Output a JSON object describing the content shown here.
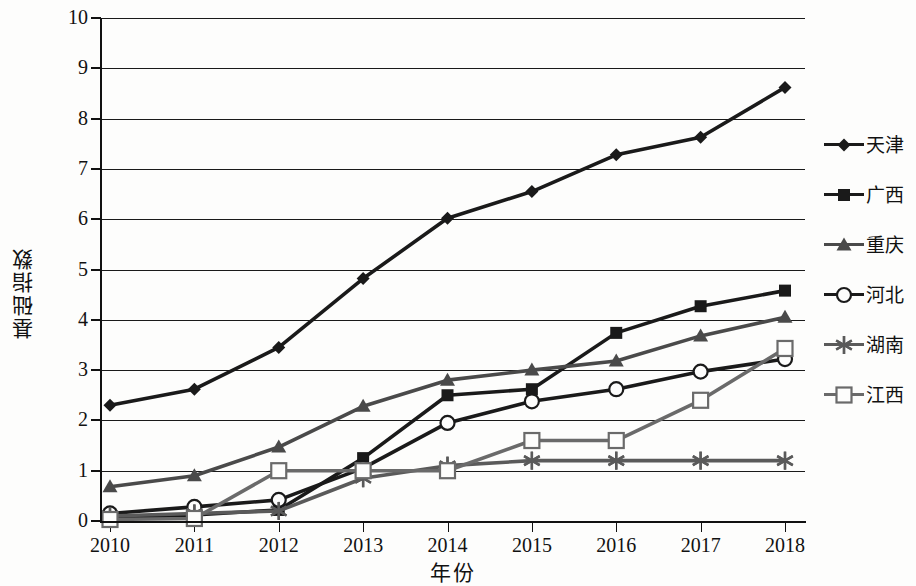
{
  "chart_data": {
    "type": "line",
    "title": "",
    "xlabel": "年份",
    "ylabel": "基础指数",
    "categories": [
      "2010",
      "2011",
      "2012",
      "2013",
      "2014",
      "2015",
      "2016",
      "2017",
      "2018"
    ],
    "x": [
      2010,
      2011,
      2012,
      2013,
      2014,
      2015,
      2016,
      2017,
      2018
    ],
    "ylim": [
      0,
      10
    ],
    "yticks": [
      0,
      1,
      2,
      3,
      4,
      5,
      6,
      7,
      8,
      9,
      10
    ],
    "ytick_labels": [
      "0",
      "1",
      "2",
      "3",
      "4",
      "5",
      "6",
      "7",
      "8",
      "9",
      "10"
    ],
    "grid": "horizontal",
    "legend_position": "right",
    "series": [
      {
        "name": "天津",
        "marker": "diamond",
        "color": "#1a1a1a",
        "values": [
          2.3,
          2.62,
          3.45,
          4.82,
          6.02,
          6.55,
          7.28,
          7.63,
          8.62
        ]
      },
      {
        "name": "广西",
        "marker": "square",
        "color": "#1a1a1a",
        "values": [
          0.05,
          0.12,
          0.22,
          1.25,
          2.5,
          2.62,
          3.74,
          4.27,
          4.58
        ]
      },
      {
        "name": "重庆",
        "marker": "triangle",
        "color": "#4a4a4a",
        "values": [
          0.68,
          0.9,
          1.47,
          2.28,
          2.8,
          3.0,
          3.18,
          3.68,
          4.05
        ]
      },
      {
        "name": "河北",
        "marker": "circle-open",
        "color": "#1a1a1a",
        "values": [
          0.15,
          0.28,
          0.42,
          1.05,
          1.95,
          2.38,
          2.62,
          2.97,
          3.22
        ]
      },
      {
        "name": "湖南",
        "marker": "asterisk",
        "color": "#5a5a5a",
        "values": [
          0.1,
          0.15,
          0.2,
          0.85,
          1.1,
          1.2,
          1.2,
          1.2,
          1.2
        ]
      },
      {
        "name": "江西",
        "marker": "square-open",
        "color": "#6a6a6a",
        "values": [
          0.03,
          0.05,
          1.0,
          1.0,
          1.0,
          1.6,
          1.6,
          2.4,
          3.43
        ]
      }
    ]
  }
}
